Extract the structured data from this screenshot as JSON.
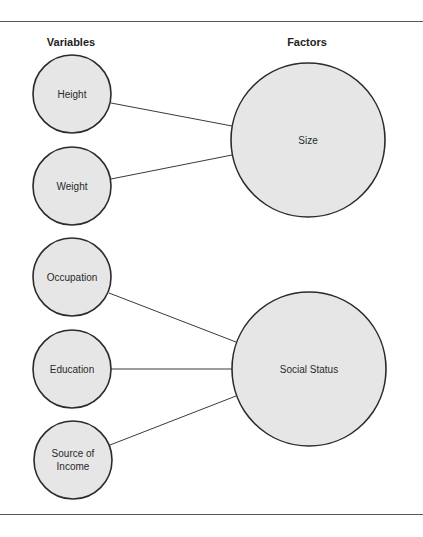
{
  "headings": {
    "variables": "Variables",
    "factors": "Factors"
  },
  "colors": {
    "node_fill": "#e6e6e6",
    "node_stroke": "#2b2b2b",
    "edge": "#3a3a3a",
    "rule": "#5a5a5a"
  },
  "variables": [
    {
      "id": "height",
      "label": "Height",
      "cx": 72,
      "cy": 94,
      "r": 39
    },
    {
      "id": "weight",
      "label": "Weight",
      "cx": 72,
      "cy": 186,
      "r": 39
    },
    {
      "id": "occupation",
      "label": "Occupation",
      "cx": 72,
      "cy": 277,
      "r": 39
    },
    {
      "id": "education",
      "label": "Education",
      "cx": 72,
      "cy": 369,
      "r": 39
    },
    {
      "id": "source-of-income",
      "label": "Source of\nIncome",
      "cx": 73,
      "cy": 460,
      "r": 39
    }
  ],
  "factors": [
    {
      "id": "size",
      "label": "Size",
      "cx": 308,
      "cy": 140,
      "r": 77
    },
    {
      "id": "social-status",
      "label": "Social Status",
      "cx": 309,
      "cy": 369,
      "r": 77
    }
  ],
  "edges": [
    {
      "from": "Height",
      "to": "Size",
      "x1": 111,
      "y1": 103,
      "x2": 232,
      "y2": 126
    },
    {
      "from": "Weight",
      "to": "Size",
      "x1": 111,
      "y1": 179,
      "x2": 232,
      "y2": 155
    },
    {
      "from": "Occupation",
      "to": "Social Status",
      "x1": 109,
      "y1": 293,
      "x2": 236,
      "y2": 342
    },
    {
      "from": "Education",
      "to": "Social Status",
      "x1": 111,
      "y1": 369,
      "x2": 233,
      "y2": 369
    },
    {
      "from": "Source of Income",
      "to": "Social Status",
      "x1": 110,
      "y1": 445,
      "x2": 236,
      "y2": 396
    }
  ]
}
